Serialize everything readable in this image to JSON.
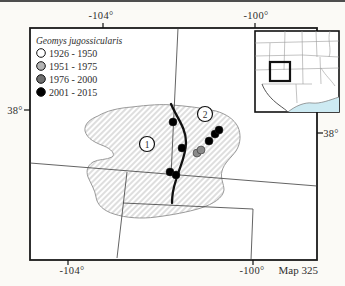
{
  "figure": {
    "species_name": "Geomys jugossicularis",
    "map_number_label": "Map 325",
    "legend": {
      "title": "Geomys jugossicularis",
      "items": [
        {
          "label": "1926 - 1950",
          "color": "#ffffff"
        },
        {
          "label": "1951 - 1975",
          "color": "#b4b4b4"
        },
        {
          "label": "1976 - 2000",
          "color": "#6f6f6f"
        },
        {
          "label": "2001 - 2015",
          "color": "#000000"
        }
      ]
    },
    "axes": {
      "top_labels": [
        "-104°",
        "-100°"
      ],
      "bottom_labels": [
        "-104°",
        "-100°"
      ],
      "left_label": "38°",
      "right_label": "38°"
    },
    "regions": [
      {
        "number": "1"
      },
      {
        "number": "2"
      }
    ],
    "colors": {
      "frame": "#1a1a1a",
      "state_line": "#3c3c3c",
      "hatch": "#9f9f9f",
      "range_outline": "#9a9a9a",
      "gulf": "#cdeaf2",
      "gray_dot": "#8a8a8a"
    }
  },
  "map_data": {
    "type": "range-map",
    "occurrences": [
      {
        "x": 173,
        "y": 122,
        "period": "2001 - 2015",
        "color": "#000000"
      },
      {
        "x": 182,
        "y": 148,
        "period": "2001 - 2015",
        "color": "#000000"
      },
      {
        "x": 170,
        "y": 172,
        "period": "2001 - 2015",
        "color": "#000000"
      },
      {
        "x": 176,
        "y": 175,
        "period": "2001 - 2015",
        "color": "#000000"
      },
      {
        "x": 209,
        "y": 141,
        "period": "2001 - 2015",
        "color": "#000000"
      },
      {
        "x": 215,
        "y": 134,
        "period": "2001 - 2015",
        "color": "#000000"
      },
      {
        "x": 219,
        "y": 130,
        "period": "2001 - 2015",
        "color": "#000000"
      },
      {
        "x": 197,
        "y": 153,
        "period": "1976 - 2000",
        "color": "#8a8a8a"
      },
      {
        "x": 201,
        "y": 150,
        "period": "1976 - 2000",
        "color": "#8a8a8a"
      }
    ]
  }
}
